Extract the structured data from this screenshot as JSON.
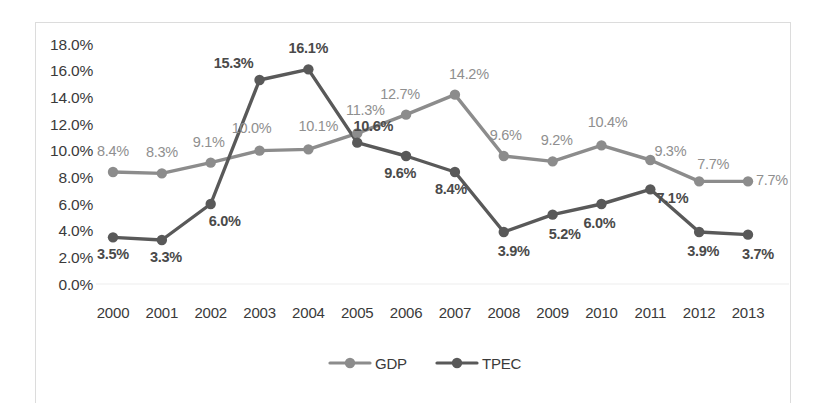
{
  "chart_data": {
    "type": "line",
    "title": "",
    "subtitle": "",
    "xlabel": "",
    "ylabel": "",
    "categories": [
      "2000",
      "2001",
      "2002",
      "2003",
      "2004",
      "2005",
      "2006",
      "2007",
      "2008",
      "2009",
      "2010",
      "2011",
      "2012",
      "2013"
    ],
    "ylim": [
      0,
      18
    ],
    "ytick_labels": [
      "18.0%",
      "16.0%",
      "14.0%",
      "12.0%",
      "10.0%",
      "8.0%",
      "6.0%",
      "4.0%",
      "2.0%",
      "0.0%"
    ],
    "ytick_values": [
      18,
      16,
      14,
      12,
      10,
      8,
      6,
      4,
      2,
      0
    ],
    "grid": false,
    "legend_position": "bottom",
    "series": [
      {
        "name": "GDP",
        "color": "#8c8c8c",
        "values": [
          8.4,
          8.3,
          9.1,
          10.0,
          10.1,
          11.3,
          12.7,
          14.2,
          9.6,
          9.2,
          10.4,
          9.3,
          7.7,
          7.7
        ],
        "labels": [
          "8.4%",
          "8.3%",
          "9.1%",
          "10.0%",
          "10.1%",
          "11.3%",
          "12.7%",
          "14.2%",
          "9.6%",
          "9.2%",
          "10.4%",
          "9.3%",
          "7.7%",
          "7.7%"
        ]
      },
      {
        "name": "TPEC",
        "color": "#595959",
        "values": [
          3.5,
          3.3,
          6.0,
          15.3,
          16.1,
          10.6,
          9.6,
          8.4,
          3.9,
          5.2,
          6.0,
          7.1,
          3.9,
          3.7
        ],
        "labels": [
          "3.5%",
          "3.3%",
          "6.0%",
          "15.3%",
          "16.1%",
          "10.6%",
          "9.6%",
          "8.4%",
          "3.9%",
          "5.2%",
          "6.0%",
          "7.1%",
          "3.9%",
          "3.7%"
        ]
      }
    ]
  },
  "legend": {
    "items": [
      {
        "label": "GDP",
        "color": "#8c8c8c"
      },
      {
        "label": "TPEC",
        "color": "#595959"
      }
    ]
  }
}
